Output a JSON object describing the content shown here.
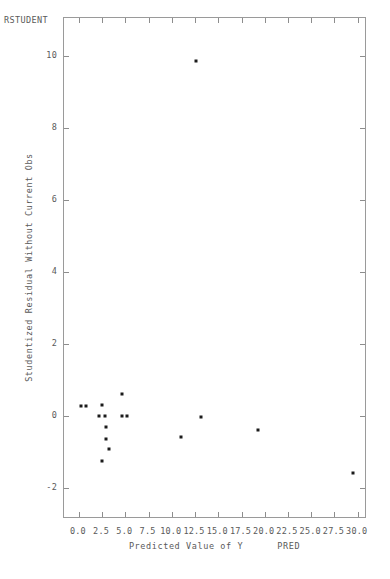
{
  "corner": {
    "label": "RSTUDENT"
  },
  "axes": {
    "x": {
      "title": "Predicted Value of Y",
      "varname": "PRED",
      "min": -1.6,
      "max": 31.0,
      "ticks": [
        0.0,
        2.5,
        5.0,
        7.5,
        10.0,
        12.5,
        15.0,
        17.5,
        20.0,
        22.5,
        25.0,
        27.5,
        30.0
      ],
      "tick_labels": [
        "0.0",
        "2.5",
        "5.0",
        "7.5",
        "10.0",
        "12.5",
        "15.0",
        "17.5",
        "20.0",
        "22.5",
        "25.0",
        "27.5",
        "30.0"
      ]
    },
    "y": {
      "title": "Studentized Residual Without Current Obs",
      "min": -2.85,
      "max": 11.05,
      "ticks": [
        -2,
        0,
        2,
        4,
        6,
        8,
        10
      ],
      "tick_labels": [
        "-2",
        "0",
        "2",
        "4",
        "6",
        "8",
        "10"
      ]
    }
  },
  "chart_data": {
    "type": "scatter",
    "title": "",
    "xlabel": "Predicted Value of Y",
    "ylabel": "Studentized Residual Without Current Obs",
    "series_name": "RSTUDENT",
    "xlim": [
      -1.6,
      31.0
    ],
    "ylim": [
      -2.85,
      11.05
    ],
    "grid": false,
    "legend": "none",
    "marker": "dot",
    "marker_color": "#1b1b1b",
    "points": [
      {
        "x": 0.2,
        "y": 0.28
      },
      {
        "x": 0.8,
        "y": 0.28
      },
      {
        "x": 2.5,
        "y": 0.31
      },
      {
        "x": 2.2,
        "y": 0.0
      },
      {
        "x": 2.8,
        "y": 0.0
      },
      {
        "x": 4.6,
        "y": 0.61
      },
      {
        "x": 4.6,
        "y": 0.0
      },
      {
        "x": 5.2,
        "y": 0.0
      },
      {
        "x": 2.9,
        "y": -0.31
      },
      {
        "x": 2.9,
        "y": -0.64
      },
      {
        "x": 3.2,
        "y": -0.92
      },
      {
        "x": 2.5,
        "y": -1.25
      },
      {
        "x": 12.6,
        "y": 9.86
      },
      {
        "x": 11.0,
        "y": -0.58
      },
      {
        "x": 13.1,
        "y": -0.03
      },
      {
        "x": 19.3,
        "y": -0.39
      },
      {
        "x": 29.5,
        "y": -1.56
      }
    ]
  }
}
